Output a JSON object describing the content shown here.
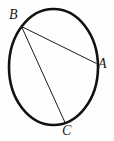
{
  "figure": {
    "kind": "circle-geometry-diagram",
    "background_color": "#fefefe",
    "stroke_color": "#111111",
    "canvas": {
      "width": 114,
      "height": 141
    },
    "circle": {
      "name": "circle-outline",
      "center_x": 53.5,
      "center_y": 67,
      "radius_x": 44.5,
      "radius_y": 58,
      "stroke_width": 2.6
    },
    "points": [
      {
        "id": "A",
        "label": "A",
        "x": 96.5,
        "y": 63.5,
        "label_x": 98,
        "label_y": 57
      },
      {
        "id": "B",
        "label": "B",
        "x": 21.5,
        "y": 26.5,
        "label_x": 9,
        "label_y": 8
      },
      {
        "id": "C",
        "label": "C",
        "x": 65.0,
        "y": 122.5,
        "label_x": 62,
        "label_y": 124
      }
    ],
    "chords": [
      {
        "id": "BA",
        "from": "B",
        "to": "A",
        "x1": 21.5,
        "y1": 26.5,
        "x2": 96.5,
        "y2": 63.5,
        "stroke_width": 1
      },
      {
        "id": "BC",
        "from": "B",
        "to": "C",
        "x1": 21.5,
        "y1": 26.5,
        "x2": 65.0,
        "y2": 122.5,
        "stroke_width": 1
      }
    ]
  }
}
